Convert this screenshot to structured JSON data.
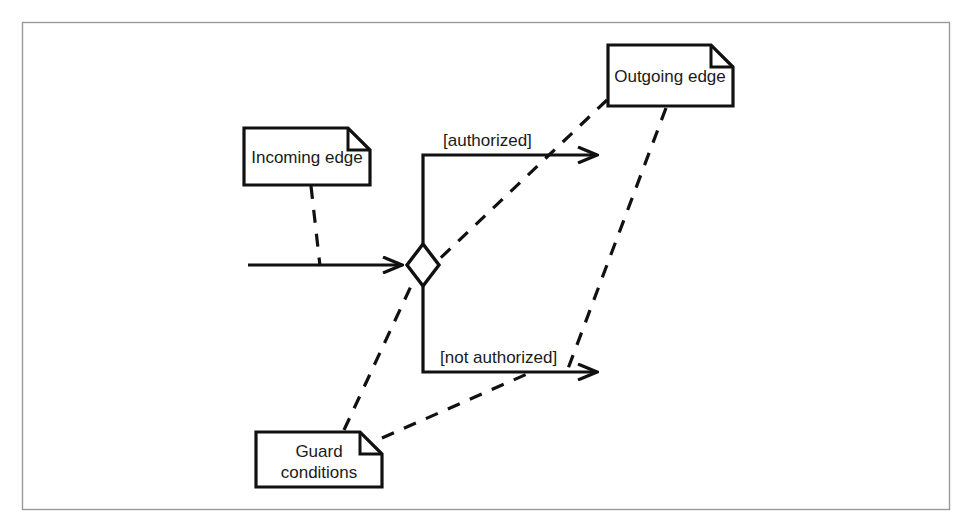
{
  "figure": {
    "kind": "uml-activity-decision-node-diagram",
    "frame": {
      "x": 22,
      "y": 22,
      "width": 928,
      "height": 488,
      "border_color": "#9a9a9a"
    },
    "background_color": "#ffffff",
    "line_color": "#111111"
  },
  "notes": [
    {
      "id": "incoming-edge-note",
      "label": "Incoming edge",
      "lines": [
        "Incoming edge"
      ],
      "x": 244,
      "y": 128,
      "width": 126,
      "height": 57,
      "fold": 22
    },
    {
      "id": "outgoing-edge-note",
      "label": "Outgoing edge",
      "lines": [
        "Outgoing edge"
      ],
      "x": 608,
      "y": 45,
      "width": 125,
      "height": 61,
      "fold": 22
    },
    {
      "id": "guard-conditions-note",
      "label": "Guard conditions",
      "lines": [
        "Guard",
        "conditions"
      ],
      "x": 256,
      "y": 432,
      "width": 126,
      "height": 55,
      "fold": 22
    }
  ],
  "decision_node": {
    "id": "decision-diamond",
    "name": "decision node",
    "cx": 423,
    "cy": 265,
    "rx": 16,
    "ry": 21
  },
  "edges": [
    {
      "id": "incoming-edge-arrow",
      "name": "incoming edge",
      "guard": "",
      "points": "248,265 405,265",
      "arrow_at": {
        "x": 405,
        "y": 265,
        "dir": "right"
      }
    },
    {
      "id": "authorized-edge-arrow",
      "name": "outgoing edge authorized",
      "guard": "[authorized]",
      "points": "423,244 423,155 596,155",
      "arrow_at": {
        "x": 600,
        "y": 155,
        "dir": "right"
      }
    },
    {
      "id": "not-authorized-edge-arrow",
      "name": "outgoing edge not authorized",
      "guard": "[not authorized]",
      "points": "423,286 423,372 568,372",
      "arrow_at": {
        "x": 600,
        "y": 372,
        "dir": "right"
      }
    }
  ],
  "guard_labels": [
    {
      "id": "guard-label-authorized",
      "text": "[authorized]",
      "x": 443,
      "y": 146
    },
    {
      "id": "guard-label-not-authorized",
      "text": "[not authorized]",
      "x": 440,
      "y": 363
    }
  ],
  "anchors": [
    {
      "id": "anchor-incoming-note",
      "from": "incoming-edge-note",
      "to": "incoming-edge-arrow",
      "points": "311,186 320,266"
    },
    {
      "id": "anchor-outgoing-note-upper",
      "from": "outgoing-edge-note",
      "to": "authorized-edge-arrow",
      "points": "607,100 430,268"
    },
    {
      "id": "anchor-outgoing-note-lower",
      "from": "outgoing-edge-note",
      "to": "not-authorized-edge-arrow",
      "points": "666,108 566,374"
    },
    {
      "id": "anchor-guard-note",
      "from": "guard-conditions-note",
      "to": "not-authorized-edge-arrow",
      "points": "382,438 527,374"
    },
    {
      "id": "anchor-guard-note-upper",
      "from": "guard-conditions-note",
      "to": "decision-diamond",
      "points": "344,430 412,284"
    }
  ],
  "caption": {
    "text": "",
    "visible_fragment": ""
  }
}
